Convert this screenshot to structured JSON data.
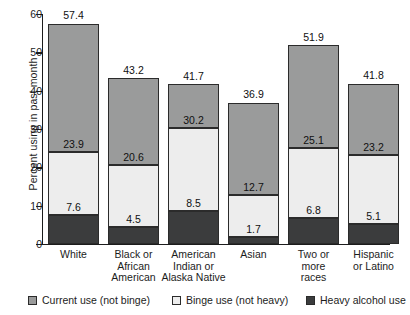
{
  "chart_data": {
    "type": "bar",
    "subtype": "stacked-vertical",
    "title": "",
    "xlabel": "",
    "ylabel": "Percent using in past month",
    "ylim": [
      0,
      60
    ],
    "yticks": [
      0,
      10,
      20,
      30,
      40,
      50,
      60
    ],
    "grid": false,
    "legend_position": "bottom",
    "categories": [
      "White",
      "Black or African American",
      "American Indian or Alaska Native",
      "Asian",
      "Two or more races",
      "Hispanic or Latino"
    ],
    "series": [
      {
        "name": "Heavy alcohol use",
        "color": "#3b3c3d",
        "values": [
          7.6,
          4.5,
          8.5,
          1.7,
          6.8,
          5.1
        ]
      },
      {
        "name": "Binge use (not heavy)",
        "color": "#ededed",
        "cumulative_values": [
          23.9,
          20.6,
          30.2,
          12.7,
          25.1,
          23.2
        ]
      },
      {
        "name": "Current use (not binge)",
        "color": "#9a9b9b",
        "cumulative_values": [
          57.4,
          43.2,
          41.7,
          36.9,
          51.9,
          41.8
        ]
      }
    ],
    "totals": [
      57.4,
      43.2,
      41.7,
      36.9,
      51.9,
      41.8
    ]
  },
  "axis": {
    "y_title": "Percent using in past month",
    "y_ticks": [
      "0",
      "10",
      "20",
      "30",
      "40",
      "50",
      "60"
    ]
  },
  "bars": [
    {
      "category_lines": [
        "White"
      ],
      "total": "57.4",
      "heavy": {
        "value": 7.6,
        "label": "7.6"
      },
      "binge_top": {
        "value": 23.9,
        "label": "23.9"
      },
      "current_top": {
        "value": 57.4,
        "label": "57.4"
      }
    },
    {
      "category_lines": [
        "Black or",
        "African",
        "American"
      ],
      "total": "43.2",
      "heavy": {
        "value": 4.5,
        "label": "4.5"
      },
      "binge_top": {
        "value": 20.6,
        "label": "20.6"
      },
      "current_top": {
        "value": 43.2,
        "label": "43.2"
      }
    },
    {
      "category_lines": [
        "American",
        "Indian or",
        "Alaska Native"
      ],
      "total": "41.7",
      "heavy": {
        "value": 8.5,
        "label": "8.5"
      },
      "binge_top": {
        "value": 30.2,
        "label": "30.2"
      },
      "current_top": {
        "value": 41.7,
        "label": "41.7"
      }
    },
    {
      "category_lines": [
        "Asian"
      ],
      "total": "36.9",
      "heavy": {
        "value": 1.7,
        "label": "1.7"
      },
      "binge_top": {
        "value": 12.7,
        "label": "12.7"
      },
      "current_top": {
        "value": 36.9,
        "label": "36.9"
      }
    },
    {
      "category_lines": [
        "Two or",
        "more",
        "races"
      ],
      "total": "51.9",
      "heavy": {
        "value": 6.8,
        "label": "6.8"
      },
      "binge_top": {
        "value": 25.1,
        "label": "25.1"
      },
      "current_top": {
        "value": 51.9,
        "label": "51.9"
      }
    },
    {
      "category_lines": [
        "Hispanic",
        "or Latino"
      ],
      "total": "41.8",
      "heavy": {
        "value": 5.1,
        "label": "5.1"
      },
      "binge_top": {
        "value": 23.2,
        "label": "23.2"
      },
      "current_top": {
        "value": 41.8,
        "label": "41.8"
      }
    }
  ],
  "legend": {
    "items": [
      {
        "label": "Current use (not binge)",
        "color": "#9a9b9b"
      },
      {
        "label": "Binge use (not heavy)",
        "color": "#ededed"
      },
      {
        "label": "Heavy alcohol use",
        "color": "#3b3c3d"
      }
    ]
  }
}
